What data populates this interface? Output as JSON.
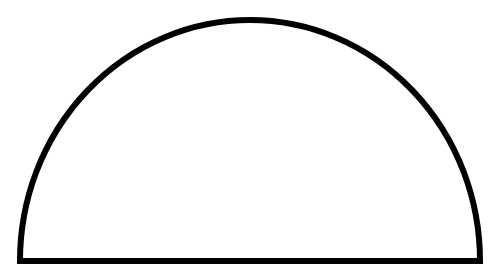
{
  "figure": {
    "shape": "semicircle",
    "background_color": "#ffffff",
    "stroke_color": "#000000",
    "fill_color": "#ffffff",
    "stroke_width": 6,
    "center_x": 250,
    "base_y": 261,
    "radius_x": 230,
    "radius_y": 240
  }
}
